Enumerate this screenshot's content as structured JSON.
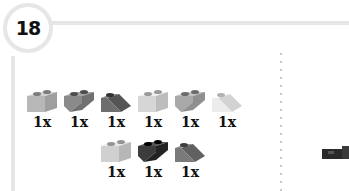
{
  "step": {
    "number": "18"
  },
  "parts_row1": [
    {
      "shape": "brick-1x2",
      "color": "#b8b8b8",
      "qty": "1x"
    },
    {
      "shape": "slope-inverted-1x2",
      "color": "#8a8a8a",
      "qty": "1x"
    },
    {
      "shape": "slope-1x2",
      "color": "#6e6e6e",
      "qty": "1x"
    },
    {
      "shape": "brick-1x2",
      "color": "#d6d6d6",
      "qty": "1x"
    },
    {
      "shape": "slope-inverted-1x2",
      "color": "#a8a8a8",
      "qty": "1x"
    },
    {
      "shape": "slope-1x2",
      "color": "#ececec",
      "qty": "1x"
    }
  ],
  "parts_row2": [
    {
      "shape": "brick-1x2",
      "color": "#d0d0d0",
      "qty": "1x"
    },
    {
      "shape": "slope-inverted-1x2",
      "color": "#3c3c3c",
      "qty": "1x"
    },
    {
      "shape": "slope-1x2",
      "color": "#7a7a7a",
      "qty": "1x"
    }
  ],
  "model": {
    "color": "#2a2a2a"
  }
}
